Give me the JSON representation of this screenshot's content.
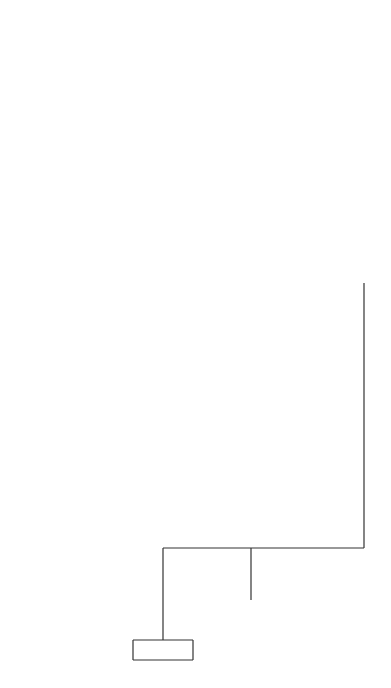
{
  "root": {
    "n": "N = 516",
    "y": "Y = 13.0",
    "label": "No. of children",
    "legend": "Sample size"
  },
  "nodes": [
    {
      "id": "groom-class",
      "label": "Groom's social class"
    },
    {
      "id": "all-classes",
      "label": "All\nclasses",
      "n": "45",
      "y": "12.2"
    },
    {
      "id": "no-job",
      "label": "No\njob",
      "n": "8",
      "y": "6.2"
    },
    {
      "id": "churchgoing-1",
      "label": "Churchgoing\nduring\nmarriage"
    },
    {
      "id": "spouse-both",
      "label": "Spouse, both,\nneither",
      "n": "53",
      "y": "11.3"
    },
    {
      "id": "respondent",
      "label": "Respon-\ndent",
      "n": "13",
      "y": "16.3"
    },
    {
      "id": "phase-wife-work",
      "label": "(Phase of\nwife's work)"
    },
    {
      "id": "more-or-less",
      "label": "More or less all the\ntime/ at beginning",
      "n": "66",
      "y": "12.3"
    },
    {
      "id": "all-others",
      "label": "All\nothers",
      "n": "13",
      "y": "17.5"
    },
    {
      "id": "first-accommodation",
      "label": "1st accommodation"
    },
    {
      "id": "rented-other",
      "label": "Rented\nother",
      "n": "79",
      "y": "13.1"
    },
    {
      "id": "buying",
      "label": "Buying",
      "n": "26",
      "y": "8.7"
    },
    {
      "id": "type-wife-work",
      "label": "Type of\nwife's\nwork"
    },
    {
      "id": "full-time-both",
      "label": "Full-time\nboth",
      "n": "105",
      "y": "12.0"
    },
    {
      "id": "part-time-rej",
      "label": "Part-time\nrej.",
      "n": "47",
      "y": "17.0"
    },
    {
      "id": "age-couple",
      "label": "Age of\ncouple"
    },
    {
      "id": "older",
      "label": "Older",
      "n": "152",
      "y": "13.6"
    },
    {
      "id": "teenage-mixed",
      "label": "Teenage\nmixed",
      "n": "93",
      "y": "10.5"
    },
    {
      "id": "second-accommodation",
      "label": "2nd accommodation sharing"
    },
    {
      "id": "parents-rej",
      "label": "Parents\nrej.",
      "n": "245",
      "y": "12.4"
    },
    {
      "id": "grooms-parents-rej",
      "label": "Groom's\nparents rej.",
      "n": "270",
      "y": "12.9"
    },
    {
      "id": "other",
      "label": "Other",
      "n": "25",
      "y": "17.5"
    },
    {
      "id": "who-opposed",
      "label": "Who opposed?"
    },
    {
      "id": "zero-two",
      "label": "0–2",
      "n": "382",
      "y": "11.8"
    },
    {
      "id": "three-plus",
      "label": "3+",
      "n": "134",
      "y": "16.5"
    },
    {
      "id": "ever-hospitalised",
      "label": "Ever\nhospital-\nised"
    },
    {
      "id": "hosp-no",
      "label": "No",
      "n": "76",
      "y": "18.0"
    },
    {
      "id": "hosp-yes",
      "label": "Yes",
      "n": "58",
      "y": "14.6"
    },
    {
      "id": "brides-parents",
      "label": "Bride's parents\nBoth parents",
      "n": "112",
      "y": "9.2"
    },
    {
      "id": "opposition",
      "label": "Opposition\nto marriage"
    },
    {
      "id": "opp-yes",
      "label": "Yes",
      "n": "21",
      "y": "14.4"
    },
    {
      "id": "opp-no",
      "label": "No",
      "n": "72",
      "y": "9.4"
    },
    {
      "id": "bride-personality",
      "label": "Bride's\nperson-\nality\ntraits"
    },
    {
      "id": "pers-1-10",
      "label": "1–10",
      "n": "44",
      "y": "7.7"
    },
    {
      "id": "pers-11-30",
      "label": "11–30",
      "n": "28",
      "y": "12.0"
    },
    {
      "id": "no-children-2",
      "label": "No. of\nchildren"
    },
    {
      "id": "ch-2",
      "label": "2",
      "n": "42",
      "y": "11.7"
    },
    {
      "id": "ch-01",
      "label": "0,1",
      "n": "70",
      "y": "7.8"
    },
    {
      "id": "churchgoing-2",
      "label": "Church-\ngoing\nduring\nmarriage"
    },
    {
      "id": "bride-only",
      "label": "Bride\nonly,\nboth",
      "n": "18",
      "y": "11.1"
    },
    {
      "id": "groom-only",
      "label": "Groom only,\nneither",
      "n": "52",
      "y": "6.6"
    }
  ]
}
